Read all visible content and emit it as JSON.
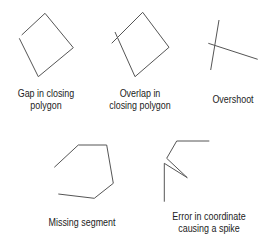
{
  "figure": {
    "stroke_color": "#555555",
    "items": [
      {
        "id": "gap",
        "label_lines": [
          "Gap in closing",
          "polygon"
        ],
        "points": [
          [
            21.7,
            35
          ],
          [
            45,
            13.3
          ],
          [
            73.3,
            47.7
          ],
          [
            38.3,
            76.7
          ],
          [
            19.3,
            38.3
          ]
        ]
      },
      {
        "id": "overlap",
        "label_lines": [
          "Overlap in",
          "closing polygon"
        ],
        "points": [
          [
            111.7,
            43.3
          ],
          [
            142.7,
            12.3
          ],
          [
            169,
            47.3
          ],
          [
            135,
            76.7
          ],
          [
            115,
            32
          ]
        ]
      },
      {
        "id": "overshoot",
        "label_lines": [
          "Overshoot"
        ],
        "lines": [
          [
            [
              219,
              20
            ],
            [
              210.7,
              70
            ]
          ],
          [
            [
              208.3,
              43.3
            ],
            [
              257.7,
              59.3
            ]
          ]
        ]
      },
      {
        "id": "missing",
        "label_lines": [
          "Missing segment"
        ],
        "points": [
          [
            54.3,
            167.3
          ],
          [
            78.3,
            145
          ],
          [
            106.7,
            145
          ],
          [
            113.3,
            183.3
          ],
          [
            94.3,
            198.3
          ],
          [
            58.3,
            194
          ]
        ]
      },
      {
        "id": "spike",
        "label_lines": [
          "Error in coordinate",
          "causing a spike"
        ],
        "points": [
          [
            209.3,
            141
          ],
          [
            176.7,
            141
          ],
          [
            166.7,
            158.3
          ],
          [
            187.3,
            177.7
          ],
          [
            164.3,
            163.3
          ],
          [
            164.3,
            201.7
          ]
        ]
      }
    ]
  }
}
